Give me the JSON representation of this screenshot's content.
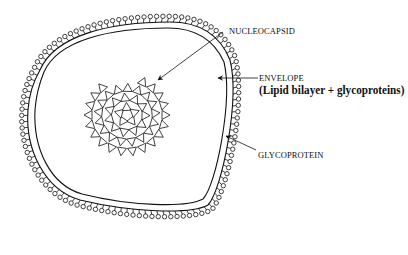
{
  "diagram": {
    "title_visible": false,
    "labels": {
      "nucleocapsid": "NUCLEOCAPSID",
      "envelope": "ENVELOPE",
      "envelope_detail": "(Lipid bilayer + glycoproteins)",
      "glycoprotein": "GLYCOPROTEIN"
    },
    "parts": [
      "envelope-outer-membrane",
      "envelope-inner-membrane",
      "glycoprotein-spikes",
      "nucleocapsid"
    ],
    "colors": {
      "ink": "#111111",
      "background": "#ffffff"
    }
  }
}
